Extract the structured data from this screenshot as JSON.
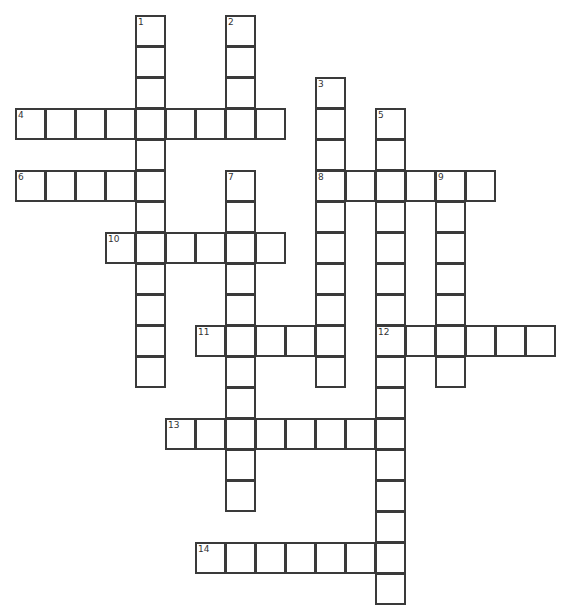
{
  "puzzle": {
    "type": "crossword",
    "cell_width": 30,
    "cell_height": 31,
    "origin_x": 15,
    "origin_y": 15,
    "colors": {
      "border": "#3a3a3a",
      "cell_fill": "#ffffff",
      "number_text": "#333333"
    },
    "entries": [
      {
        "number": "1",
        "direction": "down",
        "row": 0,
        "col": 4,
        "length": 12
      },
      {
        "number": "2",
        "direction": "down",
        "row": 0,
        "col": 7,
        "length": 4
      },
      {
        "number": "3",
        "direction": "down",
        "row": 2,
        "col": 10,
        "length": 10
      },
      {
        "number": "4",
        "direction": "across",
        "row": 3,
        "col": 0,
        "length": 9
      },
      {
        "number": "5",
        "direction": "down",
        "row": 3,
        "col": 12,
        "length": 16
      },
      {
        "number": "6",
        "direction": "across",
        "row": 5,
        "col": 0,
        "length": 5
      },
      {
        "number": "7",
        "direction": "down",
        "row": 5,
        "col": 7,
        "length": 11
      },
      {
        "number": "8",
        "direction": "across",
        "row": 5,
        "col": 10,
        "length": 6
      },
      {
        "number": "9",
        "direction": "down",
        "row": 5,
        "col": 14,
        "length": 7
      },
      {
        "number": "10",
        "direction": "across",
        "row": 7,
        "col": 3,
        "length": 6
      },
      {
        "number": "11",
        "direction": "across",
        "row": 10,
        "col": 6,
        "length": 5
      },
      {
        "number": "12",
        "direction": "across",
        "row": 10,
        "col": 12,
        "length": 6
      },
      {
        "number": "13",
        "direction": "across",
        "row": 13,
        "col": 5,
        "length": 8
      },
      {
        "number": "14",
        "direction": "across",
        "row": 17,
        "col": 6,
        "length": 7
      }
    ]
  }
}
